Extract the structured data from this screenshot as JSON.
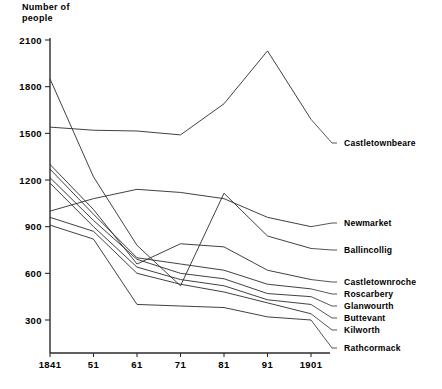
{
  "chart_data": {
    "type": "line",
    "title": "",
    "ylabel": "Number of\npeople",
    "xlabel": "",
    "grid": false,
    "legend_position": "right-inline-labels",
    "categories": [
      "1841",
      "51",
      "61",
      "71",
      "81",
      "91",
      "1901"
    ],
    "x": [
      1841,
      1851,
      1861,
      1871,
      1881,
      1891,
      1901
    ],
    "ylim": [
      0,
      2100
    ],
    "yticks": [
      300,
      600,
      900,
      1200,
      1500,
      1800,
      2100
    ],
    "series": [
      {
        "name": "Castletownbeare",
        "values": [
          1540,
          1520,
          1515,
          1490,
          1690,
          2030,
          1590
        ]
      },
      {
        "name": "Newmarket",
        "values": [
          1000,
          1080,
          1140,
          1120,
          1080,
          960,
          900
        ]
      },
      {
        "name": "Ballincollig",
        "values": [
          1850,
          1220,
          780,
          520,
          1115,
          840,
          760
        ]
      },
      {
        "name": "Castletownroche",
        "values": [
          1300,
          1010,
          660,
          790,
          770,
          620,
          560
        ]
      },
      {
        "name": "Roscarbery",
        "values": [
          1270,
          980,
          700,
          660,
          620,
          530,
          500
        ]
      },
      {
        "name": "Glanwourth",
        "values": [
          1215,
          940,
          690,
          600,
          565,
          470,
          450
        ]
      },
      {
        "name": "Buttevant",
        "values": [
          1180,
          900,
          640,
          560,
          520,
          430,
          400
        ]
      },
      {
        "name": "Kilworth",
        "values": [
          960,
          870,
          600,
          530,
          480,
          410,
          340
        ]
      },
      {
        "name": "Rathcormack",
        "values": [
          910,
          820,
          400,
          390,
          380,
          320,
          300
        ]
      }
    ],
    "labels_layout": [
      {
        "name": "Castletownbeare",
        "label_x": 344,
        "label_y": 146,
        "dash_x": 332,
        "anchor_index": 6
      },
      {
        "name": "Newmarket",
        "label_x": 344,
        "label_y": 226,
        "dash_x": 332,
        "anchor_index": 6
      },
      {
        "name": "Ballincollig",
        "label_x": 344,
        "label_y": 253,
        "dash_x": 332,
        "anchor_index": 6
      },
      {
        "name": "Castletownroche",
        "label_x": 344,
        "label_y": 285,
        "dash_x": 332,
        "anchor_index": 6
      },
      {
        "name": "Roscarbery",
        "label_x": 344,
        "label_y": 297,
        "dash_x": 332,
        "anchor_index": 6
      },
      {
        "name": "Glanwourth",
        "label_x": 344,
        "label_y": 309,
        "dash_x": 332,
        "anchor_index": 6
      },
      {
        "name": "Buttevant",
        "label_x": 344,
        "label_y": 321,
        "dash_x": 332,
        "anchor_index": 6
      },
      {
        "name": "Kilworth",
        "label_x": 344,
        "label_y": 333,
        "dash_x": 332,
        "anchor_index": 6
      },
      {
        "name": "Rathcormack",
        "label_x": 344,
        "label_y": 351,
        "dash_x": 332,
        "anchor_index": 6
      }
    ]
  },
  "colors": {
    "line": "#2b2b2b",
    "axis": "#2b2b2b",
    "text": "#000000",
    "background": "#ffffff"
  }
}
